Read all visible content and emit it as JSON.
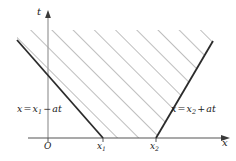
{
  "figure": {
    "type": "spacetime-diagram",
    "background_color": "#ffffff",
    "axes": {
      "x_axis": {
        "name": "x",
        "label": "x",
        "y_pixel": 138,
        "x_start": 28,
        "x_end": 228,
        "arrow": true,
        "color": "#555555"
      },
      "t_axis": {
        "name": "t",
        "label": "t",
        "x_pixel": 48,
        "y_start": 138,
        "y_end": 12,
        "arrow": true,
        "color": "#9a9a9a"
      },
      "origin": {
        "label": "O",
        "x_pixel": 48
      }
    },
    "ticks": [
      {
        "label": "O",
        "x_pixel": 48,
        "axis": "x"
      },
      {
        "label": "x",
        "sub": "1",
        "x_pixel": 103,
        "axis": "x"
      },
      {
        "label": "x",
        "sub": "2",
        "x_pixel": 156,
        "axis": "x"
      }
    ],
    "boundaries": [
      {
        "name": "left-characteristic",
        "equation_parts": {
          "lhs": "x",
          "eq": "=",
          "var": "x",
          "sub": "1",
          "op": "−",
          "rhs": "at"
        },
        "equation_text": "x=x1 − at",
        "from": {
          "x": 103,
          "y": 138
        },
        "to": {
          "x": 17,
          "y": 40
        },
        "color": "#2b2b2b",
        "width": 1.8
      },
      {
        "name": "right-characteristic",
        "equation_parts": {
          "lhs": "x",
          "eq": "=",
          "var": "x",
          "sub": "2",
          "op": "+",
          "rhs": "at"
        },
        "equation_text": "x=x2 + at",
        "from": {
          "x": 156,
          "y": 138
        },
        "to": {
          "x": 213,
          "y": 41
        },
        "color": "#2b2b2b",
        "width": 1.8
      }
    ],
    "hatched_region": {
      "name": "domain-of-dependence",
      "hatch_angle_deg": 45,
      "hatch_spacing_px": 15,
      "hatch_color": "#6f6f6f",
      "hatch_width": 0.9,
      "fill": "none"
    }
  },
  "labels": {
    "t_axis": "t",
    "x_axis": "x",
    "origin": "O",
    "x1_base": "x",
    "x1_sub": "1",
    "x2_base": "x",
    "x2_sub": "2",
    "eq_left": {
      "lhs": "x",
      "equals": "=",
      "var": "x",
      "sub": "1",
      "operator": "−",
      "term": "at"
    },
    "eq_right": {
      "lhs": "x",
      "equals": "=",
      "var": "x",
      "sub": "2",
      "operator": "+",
      "term": "at"
    }
  }
}
